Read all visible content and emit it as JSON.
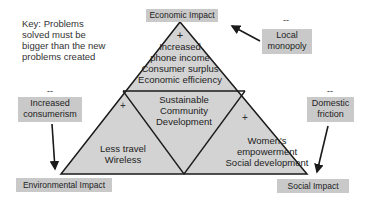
{
  "key_note": "Key:  Problems solved must be bigger than the new problems created",
  "key_lines": [
    "Key:  Problems",
    "solved must be",
    "bigger than the new",
    "problems created"
  ],
  "corners": {
    "top": "Economic Impact",
    "bottom_left": "Environmental Impact",
    "bottom_right": "Social Impact"
  },
  "center": {
    "lines": [
      "Sustainable",
      "Community",
      "Development"
    ]
  },
  "segments": {
    "top": {
      "sign": "+",
      "lines": [
        "Increased",
        "phone income",
        "Consumer surplus",
        "Economic efficiency"
      ]
    },
    "left": {
      "sign": "+",
      "lines": [
        "Less travel",
        "Wireless"
      ]
    },
    "right": {
      "sign": "+",
      "lines": [
        "Women's",
        "empowerment",
        "Social development"
      ]
    }
  },
  "negatives": {
    "economic": {
      "sign": "--",
      "lines": [
        "Local",
        "monopoly"
      ]
    },
    "environmental": {
      "sign": "--",
      "lines": [
        "Increased",
        "consumerism"
      ]
    },
    "social": {
      "sign": "--",
      "lines": [
        "Domestic",
        "friction"
      ]
    }
  },
  "colors": {
    "triangle_fill": "#d3d3d3",
    "box_fill": "#c9c9c9",
    "stroke": "#1a1a1a"
  }
}
